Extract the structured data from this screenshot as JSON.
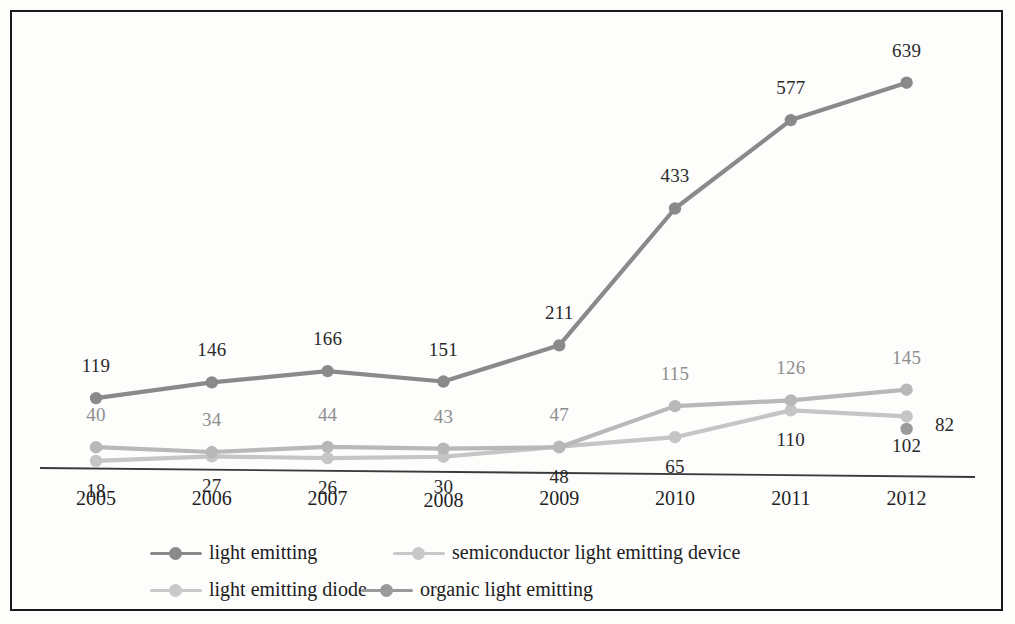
{
  "chart_data": {
    "type": "line",
    "title": "",
    "subtitle": "",
    "xlabel": "",
    "ylabel": "",
    "categories": [
      "2005",
      "2006",
      "2007",
      "2008",
      "2009",
      "2010",
      "2011",
      "2012"
    ],
    "x": [
      2005,
      2006,
      2007,
      2008,
      2009,
      2010,
      2011,
      2012
    ],
    "ylim": [
      0,
      700
    ],
    "grid": false,
    "legend_position": "bottom",
    "axis_labels_visible": false,
    "series": [
      {
        "name": "light emitting",
        "color": "#8a8a8a",
        "label_color": "#2a2a2a",
        "label_position": "above",
        "values": [
          119,
          146,
          166,
          151,
          211,
          433,
          577,
          639
        ],
        "labels": [
          "119",
          "146",
          "166",
          "151",
          "211",
          "433",
          "577",
          "639"
        ]
      },
      {
        "name": "semiconductor light emitting device",
        "color": "#b8b8b8",
        "label_color": "#8e8e8e",
        "label_position": "above",
        "values": [
          40,
          34,
          44,
          43,
          47,
          115,
          126,
          145
        ],
        "labels": [
          "40",
          "34",
          "44",
          "43",
          "47",
          "115",
          "126",
          "145"
        ]
      },
      {
        "name": "light emitting diode",
        "color": "#c5c5c5",
        "label_color": "#2a2a2a",
        "label_position": "below",
        "values": [
          18,
          27,
          26,
          30,
          48,
          65,
          110,
          102
        ],
        "labels": [
          "18",
          "27",
          "26",
          "30",
          "48",
          "65",
          "110",
          "102"
        ]
      },
      {
        "name": "organic light emitting",
        "color": "#9a9a9a",
        "label_color": "#2a2a2a",
        "label_position": "right",
        "values": [
          null,
          null,
          null,
          null,
          null,
          null,
          null,
          82
        ],
        "labels": [
          "",
          "",
          "",
          "",
          "",
          "",
          "",
          "82"
        ]
      }
    ],
    "legend": [
      {
        "label": "light emitting",
        "color": "#8a8a8a"
      },
      {
        "label": "semiconductor light emitting device",
        "color": "#c8c8c8"
      },
      {
        "label": "light emitting diode",
        "color": "#c9c9c9"
      },
      {
        "label": "organic light emitting",
        "color": "#9a9a9a"
      }
    ]
  },
  "axis": {
    "line_color": "#3a3a3a"
  },
  "frame": {
    "border_color": "#1a1a1a"
  }
}
